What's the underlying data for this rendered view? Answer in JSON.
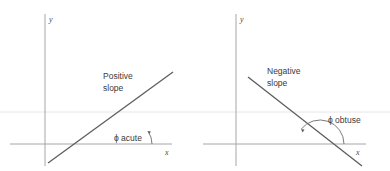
{
  "figure": {
    "background_color": "#ffffff",
    "axis_color": "#9a9aa0",
    "faint_rule_color": "#e4e4e8",
    "line_color": "#5a5a5a",
    "arc_color": "#6a6a6a",
    "text_color": "#3a3a3a",
    "faint_rule": {
      "y": 112
    },
    "panels": [
      {
        "id": "positive-slope",
        "slope_sign": "positive",
        "slope_label_line1": "Positive",
        "slope_label_line2": "slope",
        "angle_label": "ϕ acute",
        "angle_symbol": "ϕ",
        "angle_kind": "acute",
        "x_axis_label": "x",
        "y_axis_label": "y",
        "origin": {
          "x": 45,
          "y": 144
        },
        "x_axis": {
          "x1": 10,
          "y1": 144,
          "x2": 172,
          "y2": 144
        },
        "y_axis": {
          "x1": 45,
          "y1": 14,
          "x2": 45,
          "y2": 166
        },
        "line": {
          "x1": 48,
          "y1": 163,
          "x2": 173,
          "y2": 72
        },
        "vertex": {
          "x": 130,
          "y": 144
        },
        "arc_radius": 22,
        "arc_start_deg": 0,
        "arc_end_deg": 36,
        "x_label_pos": {
          "x": 167,
          "y": 154
        },
        "y_label_pos": {
          "x": 49,
          "y": 21
        },
        "slope_label_pos": {
          "x": 103,
          "y": 80
        },
        "angle_label_pos": {
          "x": 116,
          "y": 141
        }
      },
      {
        "id": "negative-slope",
        "slope_sign": "negative",
        "slope_label_line1": "Negative",
        "slope_label_line2": "slope",
        "angle_label": "ϕ obtuse",
        "angle_symbol": "ϕ",
        "angle_kind": "obtuse",
        "x_axis_label": "x",
        "y_axis_label": "y",
        "origin": {
          "x": 236,
          "y": 144
        },
        "x_axis": {
          "x1": 203,
          "y1": 144,
          "x2": 366,
          "y2": 144
        },
        "y_axis": {
          "x1": 236,
          "y1": 14,
          "x2": 236,
          "y2": 166
        },
        "line": {
          "x1": 248,
          "y1": 77,
          "x2": 362,
          "y2": 166
        },
        "vertex": {
          "x": 320,
          "y": 144
        },
        "arc_radius": 24,
        "arc_start_deg": 0,
        "arc_end_deg": 142,
        "x_label_pos": {
          "x": 358,
          "y": 154
        },
        "y_label_pos": {
          "x": 240,
          "y": 21
        },
        "slope_label_pos": {
          "x": 267,
          "y": 75
        },
        "angle_label_pos": {
          "x": 330,
          "y": 123
        }
      }
    ]
  }
}
